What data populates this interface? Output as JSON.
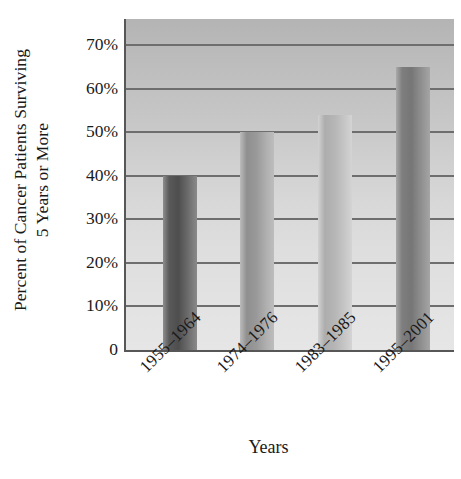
{
  "chart_data": {
    "type": "bar",
    "title": "",
    "categories": [
      "1955–1964",
      "1974–1976",
      "1983–1985",
      "1995–2001"
    ],
    "values": [
      40,
      50,
      54,
      65
    ],
    "value_unit": "%",
    "xlabel": "Years",
    "ylabel_lines": [
      "Percent of Cancer Patients Surviving",
      "5 Years or More"
    ],
    "ylabel": "Percent of Cancer Patients Surviving 5 Years or More",
    "ytick_labels": [
      "70%",
      "60%",
      "50%",
      "40%",
      "30%",
      "20%",
      "10%",
      "0"
    ],
    "ytick_values": [
      70,
      60,
      50,
      40,
      30,
      20,
      10,
      0
    ],
    "ylim": [
      0,
      76
    ],
    "grid": "horizontal",
    "legend": "none",
    "bar_colors": [
      "#4e4e4e",
      "#9a9a9a",
      "#b6b6b6",
      "#767676"
    ],
    "plot_background": "#cfcfcf",
    "axis_color": "#575757",
    "gridline_color": "#6e6e6e"
  }
}
